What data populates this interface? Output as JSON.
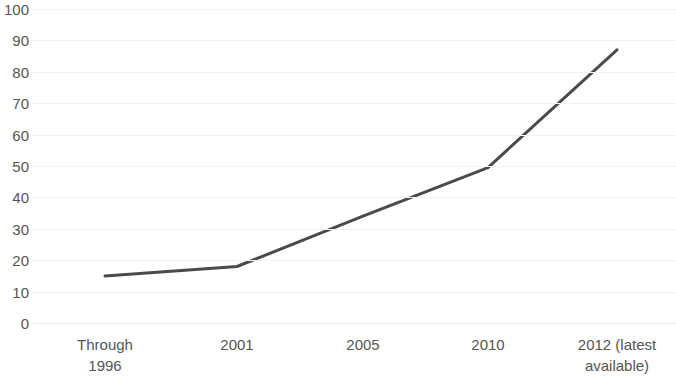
{
  "chart_data": {
    "type": "line",
    "title": "",
    "subtitle": "",
    "xlabel": "",
    "ylabel": "",
    "categories": [
      "Through 1996",
      "2001",
      "2005",
      "2010",
      "2012 (latest available)"
    ],
    "category_lines": [
      [
        "Through",
        "1996"
      ],
      [
        "2001"
      ],
      [
        "2005"
      ],
      [
        "2010"
      ],
      [
        "2012 (latest",
        "available)"
      ]
    ],
    "values": [
      15,
      18,
      34,
      49.5,
      87
    ],
    "series": [
      {
        "name": "",
        "values": [
          15,
          18,
          34,
          49.5,
          87
        ]
      }
    ],
    "ylim": [
      0,
      100
    ],
    "y_ticks": [
      0,
      10,
      20,
      30,
      40,
      50,
      60,
      70,
      80,
      90,
      100
    ],
    "y_tick_labels": [
      "0",
      "10",
      "20",
      "30",
      "40",
      "50",
      "60",
      "70",
      "80",
      "90",
      "100"
    ],
    "grid": true,
    "grid_axis": "y",
    "legend": false,
    "legend_position": "none",
    "markers": false,
    "annotations": [],
    "colors": {
      "line": "#4a4a4a",
      "grid": "#f2f2f2",
      "text": "#555555",
      "background": "#ffffff"
    },
    "line_width": 3,
    "x_positions": [
      105,
      237,
      363,
      488,
      617
    ]
  }
}
